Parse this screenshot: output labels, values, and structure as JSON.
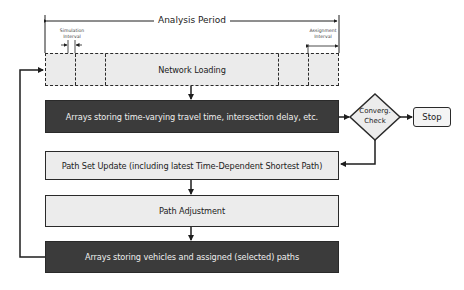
{
  "diagram": {
    "analysis_period": {
      "label": "Analysis Period"
    },
    "simulation_interval": {
      "label_line1": "Simulation",
      "label_line2": "Interval"
    },
    "assignment_interval": {
      "label_line1": "Assignment",
      "label_line2": "Interval"
    },
    "nodes": {
      "network_loading": {
        "label": "Network Loading",
        "style": "light-dashed"
      },
      "time_varying_arrays": {
        "label": "Arrays storing time-varying travel time, intersection delay, etc.",
        "style": "dark"
      },
      "path_set_update": {
        "label": "Path Set Update (including latest Time-Dependent Shortest Path)",
        "style": "light"
      },
      "path_adjustment": {
        "label": "Path Adjustment",
        "style": "light"
      },
      "vehicle_path_arrays": {
        "label": "Arrays storing vehicles and assigned (selected) paths",
        "style": "dark"
      },
      "convergence_check": {
        "label_line1": "Converg.",
        "label_line2": "Check",
        "shape": "diamond"
      },
      "stop": {
        "label": "Stop",
        "shape": "rounded-rect"
      }
    },
    "edges": [
      {
        "from": "network_loading",
        "to": "time_varying_arrays"
      },
      {
        "from": "time_varying_arrays",
        "to": "convergence_check"
      },
      {
        "from": "convergence_check",
        "to": "stop"
      },
      {
        "from": "convergence_check",
        "to": "path_set_update"
      },
      {
        "from": "path_set_update",
        "to": "path_adjustment"
      },
      {
        "from": "path_adjustment",
        "to": "vehicle_path_arrays"
      },
      {
        "from": "vehicle_path_arrays",
        "to": "network_loading"
      }
    ],
    "colors": {
      "dark_fill": "#3b3b3b",
      "light_fill": "#ececec",
      "stroke": "#2a2a2a"
    }
  }
}
